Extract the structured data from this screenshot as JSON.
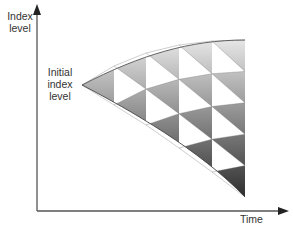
{
  "diagram": {
    "type": "binomial-tree",
    "y_axis_label_line1": "Index",
    "y_axis_label_line2": "level",
    "x_axis_label": "Time",
    "initial_label_line1": "Initial",
    "initial_label_line2": "index",
    "initial_label_line3": "level",
    "steps": 5,
    "colors": {
      "axis": "#555555",
      "white_cell": "#ffffff",
      "gray_light": "#c8c8c8",
      "gray_dark": "#3a3a3a",
      "edge": "#6a6a6a"
    }
  }
}
